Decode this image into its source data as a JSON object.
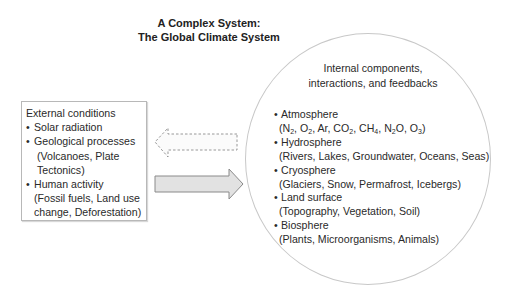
{
  "title": {
    "line1": "A Complex System:",
    "line2": "The Global Climate System"
  },
  "external": {
    "heading": "External conditions",
    "items": [
      {
        "label": "Solar radiation"
      },
      {
        "label": "Geological processes",
        "detail_line1": "(Volcanoes, Plate",
        "detail_line2": "Tectonics)"
      },
      {
        "label": "Human activity",
        "detail_line1": "(Fossil fuels, Land use",
        "detail_line2": "change, Deforestation)"
      }
    ]
  },
  "arrows": {
    "feedback_arrow": {
      "direction": "left",
      "style": "dashed",
      "meaning": "influence from internal system to external conditions"
    },
    "forcing_arrow": {
      "direction": "right",
      "style": "solid",
      "fill": "#e2e2e2",
      "stroke": "#8a8a8a"
    }
  },
  "internal": {
    "heading_line1": "Internal components,",
    "heading_line2": "interactions, and feedbacks",
    "items": [
      {
        "label": "Atmosphere",
        "detail": "(N2, O2, Ar, CO2, CH4, N2O, O3)"
      },
      {
        "label": "Hydrosphere",
        "detail": "(Rivers, Lakes, Groundwater, Oceans, Seas)"
      },
      {
        "label": "Cryosphere",
        "detail": "(Glaciers, Snow, Permafrost, Icebergs)"
      },
      {
        "label": "Land surface",
        "detail": "(Topography, Vegetation, Soil)"
      },
      {
        "label": "Biosphere",
        "detail": "(Plants, Microorganisms, Animals)"
      }
    ],
    "atmosphere_gases": [
      "N",
      "2",
      "O",
      "2",
      "Ar",
      "CO",
      "2",
      "CH",
      "4",
      "N",
      "2",
      "O",
      "O",
      "3"
    ]
  },
  "colors": {
    "text": "#2a2a2a",
    "border": "#b8b8b8",
    "circle_border": "#c8c8c8",
    "arrow_fill": "#e2e2e2",
    "arrow_stroke": "#8a8a8a",
    "dashed_stroke": "#8c8c8c"
  }
}
